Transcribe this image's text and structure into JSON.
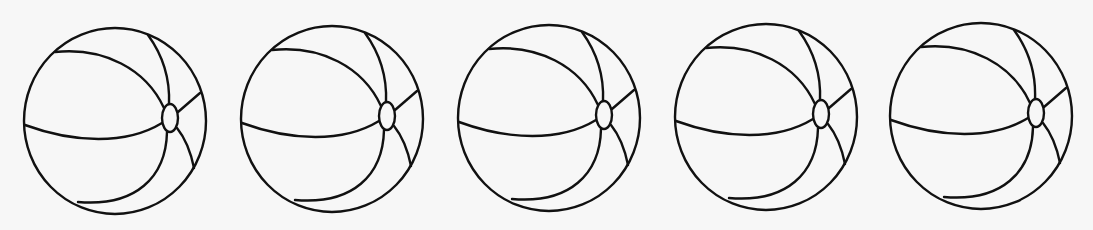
{
  "scene": {
    "description": "Five identical line-art beach balls in a row",
    "background": "#f7f7f7",
    "stroke_color": "#111111",
    "ball_count": 5
  },
  "balls": [
    {
      "id": 1,
      "x": 24,
      "y": 27
    },
    {
      "id": 2,
      "x": 241,
      "y": 25
    },
    {
      "id": 3,
      "x": 458,
      "y": 24
    },
    {
      "id": 4,
      "x": 675,
      "y": 23
    },
    {
      "id": 5,
      "x": 890,
      "y": 22
    }
  ]
}
